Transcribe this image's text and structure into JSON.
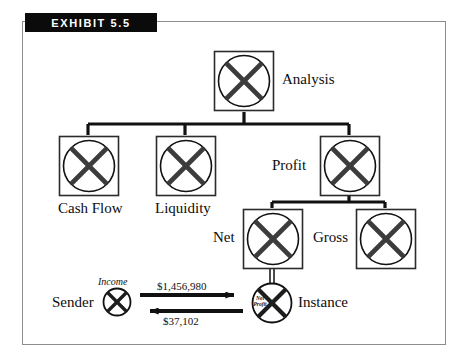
{
  "exhibit": {
    "header_label": "EXHIBIT 5.5",
    "header_bg": "#0b0b0b",
    "header_fg": "#ffffff",
    "frame_border_color": "#8d8d8d",
    "background": "#ffffff",
    "stroke_color": "#111111"
  },
  "tree": {
    "root": {
      "label": "Analysis",
      "label_side": "right"
    },
    "children": [
      {
        "label": "Cash Flow",
        "label_side": "below"
      },
      {
        "label": "Liquidity",
        "label_side": "below"
      },
      {
        "label": "Profit",
        "label_side": "left"
      }
    ],
    "profit_children": [
      {
        "label": "Net",
        "label_side": "left"
      },
      {
        "label": "Gross",
        "label_side": "left"
      }
    ]
  },
  "flow": {
    "sender_label": "Sender",
    "sender_node_label": "Income",
    "instance_label": "Instance",
    "instance_node_label_line1": "Net",
    "instance_node_label_line2": "Profit",
    "outgoing_amount": "$1,456,980",
    "incoming_amount": "$37,102",
    "outgoing_direction": "right",
    "incoming_direction": "left"
  },
  "icons": {
    "node_symbol": "circle-cross-icon",
    "arrow_right": "arrow-right-icon",
    "arrow_left": "arrow-left-icon"
  }
}
